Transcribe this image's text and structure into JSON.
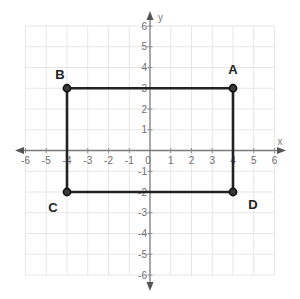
{
  "diagram": {
    "type": "coordinate-plane",
    "axes": {
      "x": {
        "label": "x",
        "min": -6,
        "max": 6,
        "ticks": [
          -6,
          -5,
          -4,
          -3,
          -2,
          -1,
          0,
          1,
          2,
          3,
          4,
          5,
          6
        ]
      },
      "y": {
        "label": "y",
        "min": -6,
        "max": 6,
        "ticks": [
          -6,
          -5,
          -4,
          -3,
          -2,
          -1,
          1,
          2,
          3,
          4,
          5,
          6
        ]
      }
    },
    "shape": "rectangle",
    "vertices": [
      {
        "label": "A",
        "x": 4,
        "y": 3
      },
      {
        "label": "B",
        "x": -4,
        "y": 3
      },
      {
        "label": "C",
        "x": -4,
        "y": -2
      },
      {
        "label": "D",
        "x": 4,
        "y": -2
      }
    ],
    "edges": [
      [
        "B",
        "A"
      ],
      [
        "A",
        "D"
      ],
      [
        "D",
        "C"
      ],
      [
        "C",
        "B"
      ]
    ],
    "colors": {
      "edge": "#222222",
      "grid": "#e6e6e6",
      "axis": "#7a7a7a",
      "label": "#222222"
    }
  }
}
